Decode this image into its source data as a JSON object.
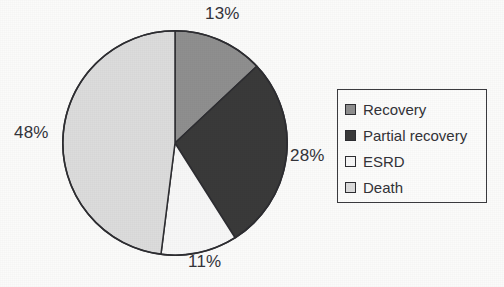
{
  "chart_data": {
    "type": "pie",
    "title": "",
    "categories": [
      "Recovery",
      "Partial recovery",
      "ESRD",
      "Death"
    ],
    "values": [
      13,
      28,
      11,
      48
    ],
    "value_labels": [
      "13%",
      "28%",
      "11%",
      "48%"
    ],
    "unit": "%",
    "total": 100,
    "start_angle_deg": 0,
    "direction": "clockwise",
    "legend_position": "right",
    "grid": false,
    "colors": [
      "#8f8f8f",
      "#3a3a3a",
      "#f7f7f7",
      "#dcdcdc"
    ],
    "slice_outline_color": "#2e2e32",
    "label_color": "#34343a",
    "slices": [
      {
        "name": "Recovery",
        "value": 13,
        "label": "13%",
        "color": "#8f8f8f",
        "label_position": "top"
      },
      {
        "name": "Partial recovery",
        "value": 28,
        "label": "28%",
        "color": "#3a3a3a",
        "label_position": "right"
      },
      {
        "name": "ESRD",
        "value": 11,
        "label": "11%",
        "color": "#f7f7f7",
        "label_position": "bottom"
      },
      {
        "name": "Death",
        "value": 48,
        "label": "48%",
        "color": "#dcdcdc",
        "label_position": "left"
      }
    ]
  },
  "labels": {
    "top": "13%",
    "right": "28%",
    "bottom": "11%",
    "left": "48%"
  },
  "legend": {
    "items": [
      {
        "label": "Recovery",
        "color": "#8f8f8f"
      },
      {
        "label": "Partial recovery",
        "color": "#3a3a3a"
      },
      {
        "label": "ESRD",
        "color": "#f7f7f7"
      },
      {
        "label": "Death",
        "color": "#dcdcdc"
      }
    ]
  }
}
